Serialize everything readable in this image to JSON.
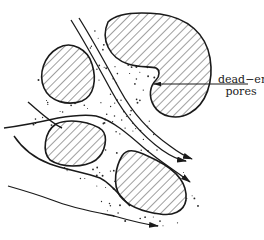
{
  "diagram": {
    "labels": {
      "dead_end_line1": "dead−end",
      "dead_end_line2": "pores"
    },
    "elements": {
      "grains": [
        "grain-upper-left",
        "grain-upper-right-large",
        "grain-lower-left",
        "grain-lower-right"
      ],
      "flow_lines": 4,
      "arrowheads": 4,
      "fill_pattern": "diagonal-hatch",
      "pore_fill": "stippled-dots"
    },
    "colors": {
      "ink": "#1a1a1a",
      "background": "#ffffff"
    }
  }
}
